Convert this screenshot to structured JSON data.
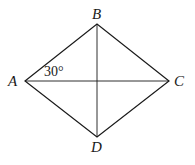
{
  "diagram": {
    "type": "rhombus",
    "vertices": {
      "A": "A",
      "B": "B",
      "C": "C",
      "D": "D"
    },
    "angle_label": "30°",
    "stroke_color": "#1a1a1a"
  }
}
